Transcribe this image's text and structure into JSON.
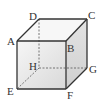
{
  "diagram": {
    "type": "cube",
    "vertices": {
      "A": {
        "label": "A",
        "x": 17,
        "y": 41
      },
      "B": {
        "label": "B",
        "x": 66,
        "y": 41
      },
      "C": {
        "label": "C",
        "x": 87,
        "y": 19
      },
      "D": {
        "label": "D",
        "x": 39,
        "y": 19
      },
      "E": {
        "label": "E",
        "x": 17,
        "y": 89
      },
      "F": {
        "label": "F",
        "x": 66,
        "y": 89
      },
      "G": {
        "label": "G",
        "x": 87,
        "y": 68
      },
      "H": {
        "label": "H",
        "x": 39,
        "y": 68
      }
    },
    "visible_edges": [
      "AB",
      "BC",
      "CD",
      "DA",
      "AE",
      "BF",
      "CG",
      "EF",
      "FG"
    ],
    "hidden_edges": [
      "DH",
      "HE",
      "HG"
    ],
    "colors": {
      "edge": "#333333",
      "hidden_edge": "#555555",
      "front_face_top": "#f4f4f4",
      "front_face_bottom": "#dedede",
      "right_face": "#d6d6d6",
      "top_face": "#f6f6f6"
    }
  }
}
